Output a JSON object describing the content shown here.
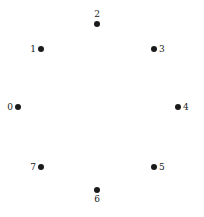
{
  "figure": {
    "type": "node-diagram",
    "background_color": "#ffffff",
    "width": 204,
    "height": 217
  },
  "style": {
    "node_color": "#1a1a1a",
    "label_color": "#1a1a1a",
    "node_diameter": 6,
    "label_font_size": 9
  },
  "chart_data": {
    "type": "scatter",
    "title": "",
    "xlabel": "",
    "ylabel": "",
    "grid": false,
    "legend": null,
    "axes_visible": false,
    "point_count": 8,
    "labels": [
      "0",
      "1",
      "2",
      "3",
      "4",
      "5",
      "6",
      "7"
    ],
    "x": [
      18,
      41,
      97,
      154,
      178,
      154,
      97,
      41
    ],
    "y": [
      107,
      49,
      24,
      49,
      107,
      167,
      190,
      167
    ],
    "points": [
      {
        "label": "0",
        "x": 18,
        "y": 107,
        "label_position": "left"
      },
      {
        "label": "1",
        "x": 41,
        "y": 49,
        "label_position": "left"
      },
      {
        "label": "2",
        "x": 97,
        "y": 24,
        "label_position": "top"
      },
      {
        "label": "3",
        "x": 154,
        "y": 49,
        "label_position": "right"
      },
      {
        "label": "4",
        "x": 178,
        "y": 107,
        "label_position": "right"
      },
      {
        "label": "5",
        "x": 154,
        "y": 167,
        "label_position": "right"
      },
      {
        "label": "6",
        "x": 97,
        "y": 190,
        "label_position": "bottom"
      },
      {
        "label": "7",
        "x": 41,
        "y": 167,
        "label_position": "left"
      }
    ]
  }
}
